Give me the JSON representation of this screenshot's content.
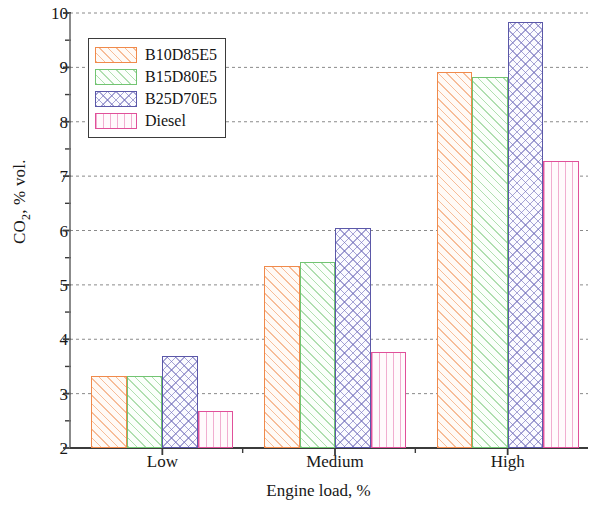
{
  "chart_data": {
    "type": "bar",
    "title": "",
    "subtitle": "",
    "xlabel": "Engine load, %",
    "ylabel": "CO2, % vol.",
    "ylabel_parts": {
      "prefix": "CO",
      "sub": "2",
      "suffix": ", % vol."
    },
    "categories": [
      "Low",
      "Medium",
      "High"
    ],
    "series": [
      {
        "name": "B10D85E5",
        "values": [
          3.33,
          5.35,
          8.92
        ],
        "color": "#f08a4b",
        "pattern": "diagonal-hatch"
      },
      {
        "name": "B15D80E5",
        "values": [
          3.32,
          5.42,
          8.83
        ],
        "color": "#72c472",
        "pattern": "diagonal-hatch"
      },
      {
        "name": "B25D70E5",
        "values": [
          3.7,
          6.05,
          9.83
        ],
        "color": "#5b58a8",
        "pattern": "cross-hatch"
      },
      {
        "name": "Diesel",
        "values": [
          2.68,
          3.77,
          7.28
        ],
        "color": "#e0509a",
        "pattern": "vertical-lines"
      }
    ],
    "ylim": [
      2,
      10
    ],
    "ytick_values": [
      2,
      3,
      4,
      5,
      6,
      7,
      8,
      9,
      10
    ],
    "ytick_labels": [
      "2",
      "3",
      "4",
      "5",
      "6",
      "7",
      "8",
      "9",
      "10"
    ],
    "yminor_step": 0.5,
    "grid": {
      "horizontal": true,
      "vertical": false,
      "style": "dotted",
      "color": "#8a8a8a"
    },
    "legend": {
      "position": "top-left-inside",
      "entries": [
        "B10D85E5",
        "B15D80E5",
        "B25D70E5",
        "Diesel"
      ]
    },
    "axes": {
      "x_line_color": "#3b3b3b",
      "y_line_color": "#6e6e6e"
    }
  }
}
